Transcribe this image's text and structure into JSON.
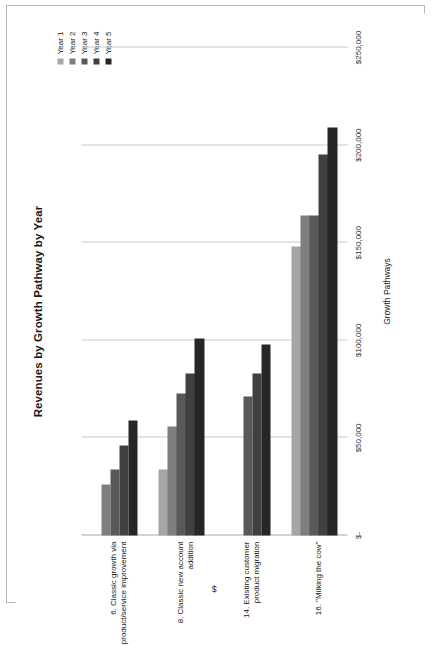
{
  "chart_data": {
    "type": "bar",
    "orientation": "vertical-grouped",
    "title": "Revenues by Growth Pathway by Year",
    "xlabel": "Growth Pathways",
    "ylabel": "$",
    "categories": [
      "6. Classic growth via product/service improvement",
      "8. Classic new account addition",
      "14. Existing customer product migration",
      "16. \"Milking the cow\""
    ],
    "series": [
      {
        "name": "Year 1",
        "color": "#a6a6a6",
        "values": [
          0,
          34000,
          0,
          148000
        ]
      },
      {
        "name": "Year 2",
        "color": "#7f7f7f",
        "values": [
          26000,
          56000,
          0,
          164000
        ]
      },
      {
        "name": "Year 3",
        "color": "#595959",
        "values": [
          34000,
          73000,
          71000,
          164000
        ]
      },
      {
        "name": "Year 4",
        "color": "#404040",
        "values": [
          46000,
          83000,
          83000,
          195000
        ]
      },
      {
        "name": "Year 5",
        "color": "#262626",
        "values": [
          59000,
          101000,
          98000,
          209000
        ]
      }
    ],
    "ylim": [
      0,
      250000
    ],
    "yticks": [
      0,
      50000,
      100000,
      150000,
      200000,
      250000
    ],
    "ytick_labels": [
      "$-",
      "$50,000",
      "$100,000",
      "$150,000",
      "$200,000",
      "$250,000"
    ],
    "grid": true,
    "legend_position": "top-right"
  }
}
